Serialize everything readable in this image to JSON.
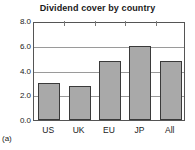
{
  "figure": {
    "panel_label": "(a)",
    "background": "#ffffff"
  },
  "chart_data": {
    "type": "bar",
    "title": "Dividend cover by country",
    "xlabel": "",
    "ylabel": "",
    "categories": [
      "US",
      "UK",
      "EU",
      "JP",
      "All"
    ],
    "values": [
      3.0,
      2.75,
      4.8,
      6.0,
      4.8
    ],
    "ylim": [
      0.0,
      8.0
    ],
    "ytick_labels": [
      "8.0",
      "6.0",
      "4.0",
      "2.0",
      "0.0"
    ],
    "ytick_values": [
      8.0,
      6.0,
      4.0,
      2.0,
      0.0
    ],
    "grid": true,
    "grid_axis": "y",
    "legend": false,
    "bar_color": "#a9a9a9",
    "bar_edge_color": "#3a3a3a",
    "grid_color": "#9a9a9a",
    "frame_color": "#555555",
    "text_color": "#1a1a1a"
  }
}
